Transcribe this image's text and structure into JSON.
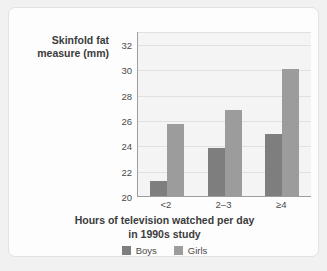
{
  "chart_data": {
    "type": "bar",
    "title": "",
    "subtitle": "",
    "xlabel": "Hours of television watched per day in 1990s study",
    "xlabel_line1": "Hours of television watched per day",
    "xlabel_line2": "in 1990s study",
    "ylabel": "Skinfold fat measure (mm)",
    "ylabel_line1": "Skinfold fat",
    "ylabel_line2": "measure (mm)",
    "categories": [
      "<2",
      "2–3",
      "≥4"
    ],
    "series": [
      {
        "name": "Boys",
        "values": [
          21.2,
          23.8,
          24.9
        ],
        "color": "#7e7e7e"
      },
      {
        "name": "Girls",
        "values": [
          25.7,
          26.8,
          30.1
        ],
        "color": "#9c9c9c"
      }
    ],
    "ylim": [
      20,
      33
    ],
    "yticks": [
      20,
      22,
      24,
      26,
      28,
      30,
      32
    ],
    "ytick_labels": [
      "20",
      "22",
      "24",
      "26",
      "28",
      "30",
      "32"
    ],
    "grid": true,
    "grid_orientation": "horizontal",
    "legend": [
      "Boys",
      "Girls"
    ],
    "legend_position": "bottom-center",
    "plot_background": "#f4f4f4",
    "axis_color": "#9e9e9e",
    "gridline_color": "#e0e0e0"
  },
  "card": {
    "background": "#fdfdfd",
    "border_color": "#e2e2e2"
  }
}
